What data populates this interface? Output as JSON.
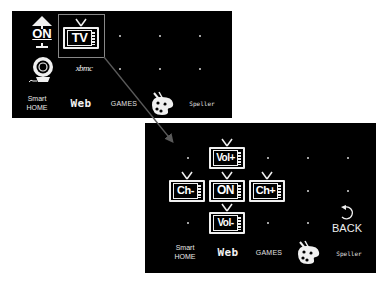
{
  "main_panel": {
    "row1": {
      "power_on_label": "ON",
      "tv_label": "TV"
    },
    "row2": {
      "webcam_icon": "webcam-icon",
      "xbmc_label": "xbmc"
    },
    "bottom_bar": {
      "smart_home_line1": "Smart",
      "smart_home_line2": "HOME",
      "web_label": "Web",
      "games_label": "GAMES",
      "paint_icon": "paint-palette-icon",
      "speller_label": "Speller"
    },
    "selected_item": "TV"
  },
  "tv_panel": {
    "controls": {
      "vol_up": "Vol+",
      "ch_down": "Ch-",
      "power": "ON",
      "ch_up": "Ch+",
      "vol_down": "Vol-"
    },
    "back_label": "BACK",
    "bottom_bar": {
      "smart_home_line1": "Smart",
      "smart_home_line2": "HOME",
      "web_label": "Web",
      "games_label": "GAMES",
      "paint_icon": "paint-palette-icon",
      "speller_label": "Speller"
    }
  },
  "colors": {
    "panel_background": "#000000",
    "page_background": "#ffffff",
    "icon_foreground": "#f0f0f0",
    "highlight_border": "#888888",
    "connector_line": "#555555"
  }
}
